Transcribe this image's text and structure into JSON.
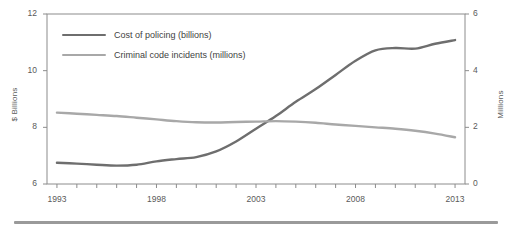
{
  "chart_data": {
    "type": "line",
    "title": "",
    "xlabel": "",
    "ylabel": "$ Billions",
    "ylabel_secondary": "Millions",
    "grid": false,
    "legend_position": "top-left inside",
    "x": [
      1993,
      1994,
      1995,
      1996,
      1997,
      1998,
      1999,
      2000,
      2001,
      2002,
      2003,
      2004,
      2005,
      2006,
      2007,
      2008,
      2009,
      2010,
      2011,
      2012,
      2013
    ],
    "xlim": [
      1992.5,
      2013.5
    ],
    "xticks": [
      1993,
      1994,
      1995,
      1996,
      1997,
      1998,
      1999,
      2000,
      2001,
      2002,
      2003,
      2004,
      2005,
      2006,
      2007,
      2008,
      2009,
      2010,
      2011,
      2012,
      2013
    ],
    "xtick_labels": [
      "1993",
      "1998",
      "2003",
      "2008",
      "2013"
    ],
    "xtick_label_values": [
      1993,
      1998,
      2003,
      2008,
      2013
    ],
    "ylim": [
      6,
      12
    ],
    "yticks": [
      6,
      8,
      10,
      12
    ],
    "ytick_labels": [
      "6",
      "8",
      "10",
      "12"
    ],
    "ylim_secondary": [
      0,
      6
    ],
    "yticks_secondary": [
      0,
      2,
      4,
      6
    ],
    "ytick_labels_secondary": [
      "0",
      "2",
      "4",
      "6"
    ],
    "series": [
      {
        "name": "Cost of policing (billions)",
        "axis": "left",
        "color": "#6e6e6e",
        "values": [
          6.75,
          6.72,
          6.68,
          6.65,
          6.68,
          6.8,
          6.88,
          6.95,
          7.15,
          7.5,
          7.95,
          8.4,
          8.9,
          9.35,
          9.85,
          10.35,
          10.72,
          10.8,
          10.78,
          10.95,
          11.08
        ]
      },
      {
        "name": "Criminal code incidents (millions)",
        "axis": "right",
        "color": "#a8a8a8",
        "values": [
          2.52,
          2.48,
          2.44,
          2.4,
          2.34,
          2.28,
          2.22,
          2.18,
          2.17,
          2.19,
          2.2,
          2.22,
          2.2,
          2.16,
          2.1,
          2.05,
          2.0,
          1.95,
          1.88,
          1.78,
          1.65
        ]
      }
    ]
  },
  "legend": {
    "items": [
      {
        "label": "Cost of policing (billions)",
        "color": "#6e6e6e"
      },
      {
        "label": "Criminal code incidents (millions)",
        "color": "#a8a8a8"
      }
    ]
  }
}
